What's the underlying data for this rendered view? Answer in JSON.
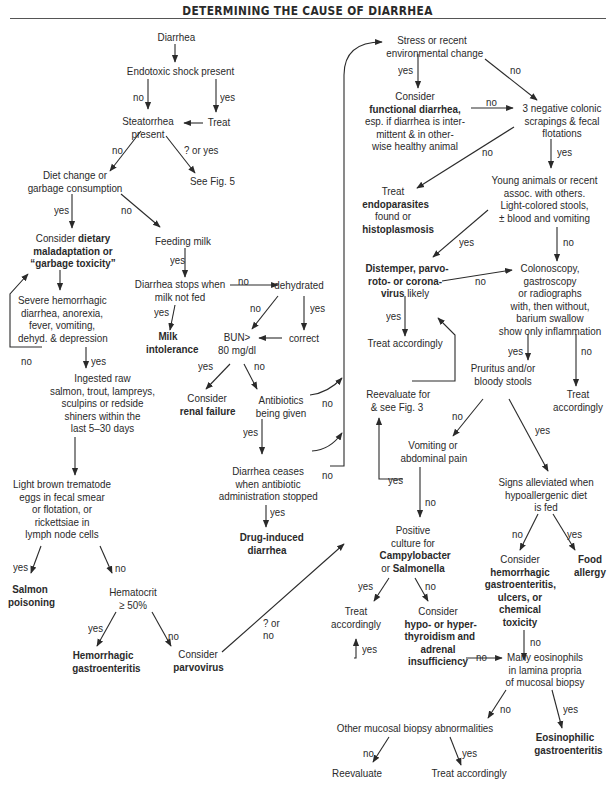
{
  "title": "DETERMINING THE CAUSE OF DIARRHEA",
  "nodes": {
    "diarrhea": "Diarrhea",
    "endotoxic": "Endotoxic shock present",
    "treat": "Treat",
    "steatorrhea": [
      "Steatorrhea",
      "present"
    ],
    "see_fig5": "See Fig. 5",
    "diet_change": [
      "Diet change or",
      "garbage consumption"
    ],
    "consider_dietary": {
      "pre": "Consider ",
      "b1": "dietary",
      "b2": "maladaptation or",
      "b3": "“garbage toxicity”"
    },
    "feeding_milk": "Feeding milk",
    "stops_milk": [
      "Diarrhea stops when",
      "milk not fed"
    ],
    "milk_intolerance": [
      "Milk",
      "intolerance"
    ],
    "dehydrated": "dehydrated",
    "correct": "correct",
    "bun": [
      "BUN>",
      "80 mg/dl"
    ],
    "renal": {
      "pre": "Consider",
      "b": "renal failure"
    },
    "antibiotics": [
      "Antibiotics",
      "being given"
    ],
    "ceases": [
      "Diarrhea ceases",
      "when antibiotic",
      "administration stopped"
    ],
    "drug_induced": [
      "Drug-induced",
      "diarrhea"
    ],
    "severe": [
      "Severe hemorrhagic",
      "diarrhea, anorexia,",
      "fever, vomiting,",
      "dehyd. & depression"
    ],
    "ingested": [
      "Ingested raw",
      "salmon, trout, lampreys,",
      "sculpins or redside",
      "shiners within the",
      "last 5–30 days"
    ],
    "trematode": [
      "Light brown trematode",
      "eggs in fecal smear",
      "or flotation, or",
      "rickettsiae in",
      "lymph node cells"
    ],
    "salmon": [
      "Salmon",
      "poisoning"
    ],
    "hematocrit": [
      "Hematocrit",
      "≥ 50%"
    ],
    "hemorrhagic_ge": [
      "Hemorrhagic",
      "gastroenteritis"
    ],
    "parvo": {
      "pre": "Consider",
      "b": "parvovirus"
    },
    "stress": [
      "Stress or recent",
      "environmental change"
    ],
    "functional": {
      "pre": "Consider",
      "b": "functional diarrhea,",
      "l3": "esp. if diarrhea is inter-",
      "l4": "mittent & in other-",
      "l5": "wise healthy animal"
    },
    "negative": [
      "3 negative colonic",
      "scrapings & fecal",
      "flotations"
    ],
    "endoparasites": {
      "l1": "Treat",
      "b1": "endoparasites",
      "l3": "found or",
      "b2": "histoplasmosis"
    },
    "young": [
      "Young animals or recent",
      "assoc. with others.",
      "Light-colored stools,",
      "± blood and vomiting"
    ],
    "distemper": {
      "b1": "Distemper, parvo-",
      "b2": "roto- or corona-",
      "b3": "virus",
      "tail": " likely"
    },
    "treat_acc1": "Treat accordingly",
    "colonoscopy": [
      "Colonoscopy,",
      "gastroscopy",
      "or radiographs",
      "with, then without,",
      "barium swallow",
      "show only inflammation"
    ],
    "reevaluate_fig3": [
      "Reevaluate for",
      "& see Fig. 3"
    ],
    "pruritus": [
      "Pruritus and/or",
      "bloody stools"
    ],
    "treat_acc2": [
      "Treat",
      "accordingly"
    ],
    "vomiting": [
      "Vomiting or",
      "abdominal pain"
    ],
    "signs": [
      "Signs alleviated when",
      "hypoallergenic diet",
      "is fed"
    ],
    "positive": {
      "l1": "Positive",
      "l2": "culture for",
      "b1": "Campylobacter",
      "pre": "or ",
      "b2": "Salmonella"
    },
    "consider_hem": {
      "pre": "Consider",
      "b": [
        "hemorrhagic",
        "gastroenteritis,",
        "ulcers, or",
        "chemical",
        "toxicity"
      ]
    },
    "food_allergy": [
      "Food",
      "allergy"
    ],
    "treat_acc3": [
      "Treat",
      "accordingly"
    ],
    "thyroid": {
      "pre": "Consider",
      "b": [
        "hypo- or hyper-",
        "thyroidism and",
        "adrenal",
        "insufficiency"
      ]
    },
    "eosinophils": [
      "Many eosinophils",
      "in lamina propria",
      "of mucosal biopsy"
    ],
    "other_mucosal": "Other mucosal biopsy abnormalities",
    "eosinophilic": [
      "Eosinophilic",
      "gastroenteritis"
    ],
    "reevaluate": "Reevaluate",
    "treat_acc4": "Treat accordingly"
  },
  "labels": {
    "yes": "yes",
    "no": "no",
    "q_or_yes": "? or yes",
    "q_or": "? or",
    "q_no": "no"
  }
}
